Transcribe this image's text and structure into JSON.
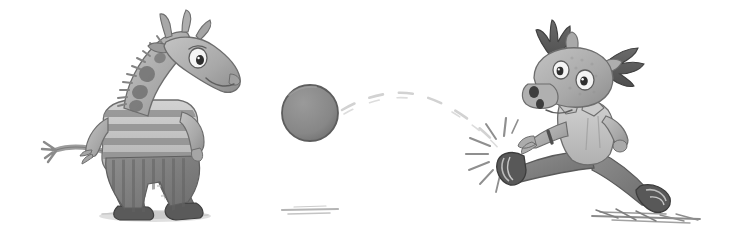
{
  "scene": {
    "title": "Giraffe and moose playing ball",
    "width": 730,
    "height": 250,
    "background_color": "#ffffff",
    "style": "grayscale pencil-and-wash children's book illustration",
    "alt_text": "A striped-shirt giraffe on the left and a running antlered moose on the right with a gray ball bouncing between them along a dashed arc"
  },
  "palette": {
    "background": "#ffffff",
    "ball_fill": "#878787",
    "ball_outline": "#5a5a5a",
    "body_light": "#b9b9b9",
    "body_mid": "#9a9a9a",
    "body_shade": "#848484",
    "spot_dark": "#6f6f6f",
    "antler_dark": "#5e5e5e",
    "shirt_light": "#c9c9c9",
    "stripe_dark": "#8a8a8a",
    "pants_dark": "#7a7a7a",
    "shoe_dark": "#565656",
    "eye_white": "#f4f4f4",
    "pupil": "#2e2e2e",
    "outline": "#4a4a4a",
    "shadow_ground": "#cfcfcf",
    "trail_line": "#d8d8d8",
    "impact_line": "#8f8f8f"
  },
  "characters": [
    {
      "id": "giraffe",
      "name": "Giraffe",
      "role": "thrower",
      "position": "left",
      "center_x": 150,
      "center_y": 120,
      "facing": "right",
      "pose": "leaning forward, arms back, about to catch or having thrown",
      "features": {
        "horns": 3,
        "eyes": 1,
        "neck_spots": 4,
        "mane": "spiky",
        "tail": "curved left with tuft"
      },
      "clothing": {
        "top": "horizontally striped short-sleeve shirt",
        "bottom": "vertically striped pants",
        "shoes": "dark sneakers"
      }
    },
    {
      "id": "moose",
      "name": "Moose",
      "role": "kicker",
      "position": "right",
      "center_x": 585,
      "center_y": 120,
      "facing": "left",
      "pose": "running and kicking, front leg extended forward",
      "features": {
        "antlers": 2,
        "ears": 2,
        "eyes": 2,
        "nostrils": 2,
        "wristband": 1
      },
      "clothing": {
        "top": "light collared shirt",
        "bottom": "dark pants",
        "shoes": "dark sneakers"
      }
    }
  ],
  "objects": [
    {
      "id": "ball",
      "name": "Ball",
      "shape": "circle",
      "center_x": 310,
      "center_y": 113,
      "radius": 28,
      "fill": "#878787"
    },
    {
      "id": "motion-trail",
      "name": "Dashed bounce trail",
      "shape": "dashed arc",
      "from_x": 340,
      "from_y": 112,
      "peak_x": 412,
      "peak_y": 94,
      "to_x": 498,
      "to_y": 146
    },
    {
      "id": "impact-burst",
      "name": "Kick impact burst",
      "center_x": 505,
      "center_y": 155,
      "ray_count": 8
    }
  ],
  "ground_marks": [
    {
      "id": "giraffe-shadow",
      "name": "Giraffe ground shadow",
      "x": 155,
      "y": 216,
      "width": 110,
      "height": 12
    },
    {
      "id": "center-scuff",
      "name": "Center ground scuff",
      "x": 295,
      "y": 212,
      "width": 50,
      "height": 8
    },
    {
      "id": "moose-speed-lines",
      "name": "Moose speed lines",
      "x": 645,
      "y": 214,
      "width": 120,
      "height": 12
    }
  ]
}
